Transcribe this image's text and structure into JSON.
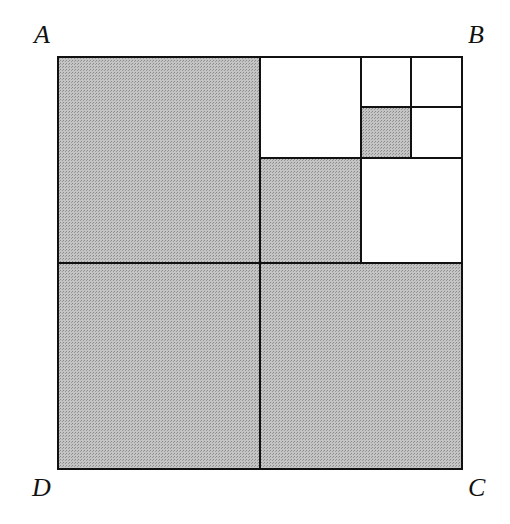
{
  "diagram": {
    "type": "nested-squares",
    "labels": {
      "A": "A",
      "B": "B",
      "C": "C",
      "D": "D"
    },
    "colors": {
      "shade": "#b5b5b5",
      "stroke": "#111111",
      "background": "#ffffff"
    },
    "square": {
      "x": 58,
      "y": 57,
      "size": 404
    },
    "regions": [
      {
        "name": "top-left-quadrant",
        "shaded": true
      },
      {
        "name": "bottom-left-quadrant",
        "shaded": true
      },
      {
        "name": "bottom-right-quadrant",
        "shaded": true
      },
      {
        "name": "tr-top-left",
        "shaded": false
      },
      {
        "name": "tr-bottom-left",
        "shaded": true
      },
      {
        "name": "tr-bottom-right",
        "shaded": false
      },
      {
        "name": "tr2-top-left",
        "shaded": false
      },
      {
        "name": "tr2-top-right",
        "shaded": false
      },
      {
        "name": "tr2-bottom-left",
        "shaded": true
      },
      {
        "name": "tr2-bottom-right",
        "shaded": false
      }
    ]
  }
}
